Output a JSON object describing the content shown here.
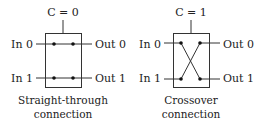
{
  "diagram": {
    "colors": {
      "stroke": "#333333",
      "text": "#222222",
      "background": "#ffffff"
    },
    "switches": [
      {
        "control_label": "C = 0",
        "inputs": [
          "In 0",
          "In 1"
        ],
        "outputs": [
          "Out 0",
          "Out 1"
        ],
        "mode": "straight",
        "caption_line1": "Straight-through",
        "caption_line2": "connection"
      },
      {
        "control_label": "C = 1",
        "inputs": [
          "In 0",
          "In 1"
        ],
        "outputs": [
          "Out 0",
          "Out 1"
        ],
        "mode": "crossover",
        "caption_line1": "Crossover",
        "caption_line2": "connection"
      }
    ]
  }
}
